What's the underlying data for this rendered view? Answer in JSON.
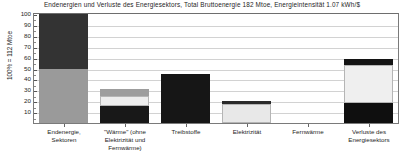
{
  "chart_data": {
    "type": "bar",
    "title": "Endenergien und Verluste des Energiesektors,  Total Bruttoenergie 182 Mtoe,  Energieintensität  1.07 kWh/$",
    "xlabel": "",
    "ylabel": "100% = 112 Mtoe",
    "ylim": [
      0,
      100
    ],
    "yticks": [
      10,
      20,
      30,
      40,
      50,
      60,
      70,
      80,
      90,
      100
    ],
    "ytick_labels": [
      "10",
      "20",
      "30",
      "40",
      "50",
      "60",
      "70",
      "80",
      "90",
      "100"
    ],
    "grid": true,
    "legend": "none",
    "stacked": true,
    "categories": [
      "Endenergie, Sektoren",
      "\"Wärme\" (ohne Elektrizität und Fernwärme)",
      "Treibstoffe",
      "Elektrizität",
      "Fernwärme",
      "Verluste des Energiesektors"
    ],
    "category_lines": [
      [
        "Endenergie,",
        "Sektoren"
      ],
      [
        "\"Wärme\" (ohne",
        "Elektrizität und",
        "Fernwärme)"
      ],
      [
        "Treibstoffe"
      ],
      [
        "Elektrizität"
      ],
      [
        "Fernwärme"
      ],
      [
        "Verluste des",
        "Energiesektors"
      ]
    ],
    "series": [
      {
        "name": "segment-lower",
        "color": "#9a9a9a",
        "values": [
          50,
          16,
          0,
          18,
          0,
          18
        ]
      },
      {
        "name": "segment-middle",
        "color": "#efefef",
        "values": [
          0,
          8,
          0,
          2,
          0,
          36
        ]
      },
      {
        "name": "segment-upper",
        "color": "#3a3a3a",
        "values": [
          50,
          6,
          45,
          1,
          0,
          5
        ]
      }
    ],
    "bars": [
      {
        "category": "Endenergie, Sektoren",
        "total": 100,
        "segments": [
          {
            "name": "lower",
            "from": 0,
            "to": 50,
            "color": "#9a9a9a"
          },
          {
            "name": "upper",
            "from": 50,
            "to": 100,
            "color": "#333333"
          }
        ]
      },
      {
        "category": "\"Wärme\" (ohne Elektrizität und Fernwärme)",
        "total": 31,
        "segments": [
          {
            "name": "lower",
            "from": 0,
            "to": 16,
            "color": "#181818"
          },
          {
            "name": "middle",
            "from": 16,
            "to": 25,
            "color": "#ededed"
          },
          {
            "name": "upper",
            "from": 25,
            "to": 31,
            "color": "#9d9d9d"
          }
        ]
      },
      {
        "category": "Treibstoffe",
        "total": 45,
        "segments": [
          {
            "name": "single",
            "from": 0,
            "to": 45,
            "color": "#161616"
          }
        ]
      },
      {
        "category": "Elektrizität",
        "total": 20,
        "segments": [
          {
            "name": "lower",
            "from": 0,
            "to": 17,
            "color": "#e8e8e8"
          },
          {
            "name": "upper",
            "from": 17,
            "to": 20,
            "color": "#2a2a2a"
          }
        ]
      },
      {
        "category": "Fernwärme",
        "total": 0,
        "segments": []
      },
      {
        "category": "Verluste des Energiesektors",
        "total": 59,
        "segments": [
          {
            "name": "lower",
            "from": 0,
            "to": 18,
            "color": "#0f0f0f"
          },
          {
            "name": "middle",
            "from": 18,
            "to": 53,
            "color": "#efefef"
          },
          {
            "name": "upper",
            "from": 53,
            "to": 59,
            "color": "#141414"
          }
        ]
      }
    ]
  },
  "colors": {
    "axis": "#7a7a7a",
    "grid": "#d2d2d2",
    "text": "#1e1e1e",
    "background": "#ffffff"
  }
}
